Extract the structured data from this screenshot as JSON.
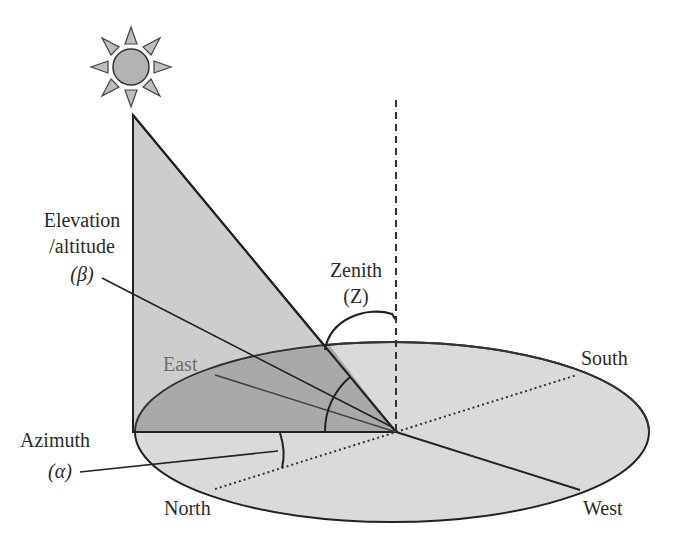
{
  "diagram": {
    "labels": {
      "elevation_line1": "Elevation",
      "elevation_line2": "/altitude",
      "elevation_symbol": "(β)",
      "zenith": "Zenith",
      "zenith_symbol": "(Z)",
      "azimuth": "Azimuth",
      "azimuth_symbol": "(α)",
      "east": "East",
      "south": "South",
      "north": "North",
      "west": "West"
    },
    "icons": {
      "sun": "sun-icon"
    },
    "colors": {
      "background": "#ffffff",
      "ground_plane": "#d9d9d9",
      "triangle": "#cfcfcf",
      "shadow_wedge": "#a9a9a9",
      "stroke": "#222222",
      "east_label": "#6f6f6f"
    }
  }
}
